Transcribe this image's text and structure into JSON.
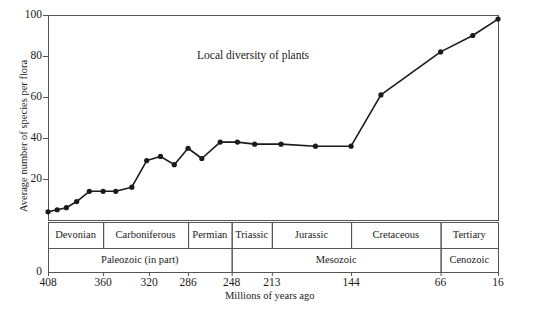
{
  "chart_data": {
    "type": "line",
    "title": "Local diversity of plants",
    "xlabel": "Millions of years ago",
    "ylabel": "Average number of species per flora",
    "xlim": [
      408,
      16
    ],
    "ylim": [
      0,
      100
    ],
    "x_reversed": true,
    "grid": false,
    "legend": "none",
    "xticks": [
      408,
      360,
      320,
      286,
      248,
      213,
      144,
      66,
      16
    ],
    "xtick_labels": [
      "408",
      "360",
      "320",
      "286",
      "248",
      "213",
      "144",
      "66",
      "16"
    ],
    "yticks": [
      0,
      20,
      40,
      60,
      80,
      100
    ],
    "ytick_labels": [
      "0",
      "20",
      "40",
      "60",
      "80",
      "100"
    ],
    "marker": "filled-circle",
    "line_color": "#1a1a1a",
    "series": [
      {
        "name": "Local diversity of plants",
        "x": [
          408,
          400,
          392,
          383,
          372,
          360,
          349,
          335,
          322,
          310,
          298,
          286,
          274,
          258,
          243,
          228,
          205,
          175,
          144,
          118,
          66,
          38,
          16
        ],
        "y": [
          4,
          5,
          6,
          9,
          14,
          14,
          14,
          16,
          29,
          31,
          27,
          35,
          30,
          38,
          38,
          37,
          37,
          36,
          36,
          61,
          82,
          90,
          98
        ]
      }
    ],
    "period_bands": [
      {
        "label": "Devonian",
        "start": 408,
        "end": 360
      },
      {
        "label": "Carboniferous",
        "start": 360,
        "end": 286
      },
      {
        "label": "Permian",
        "start": 286,
        "end": 248
      },
      {
        "label": "Triassic",
        "start": 248,
        "end": 213
      },
      {
        "label": "Jurassic",
        "start": 213,
        "end": 144
      },
      {
        "label": "Cretaceous",
        "start": 144,
        "end": 66
      },
      {
        "label": "Tertiary",
        "start": 66,
        "end": 16
      }
    ],
    "era_bands": [
      {
        "label": "Paleozoic (in part)",
        "start": 408,
        "end": 248
      },
      {
        "label": "Mesozoic",
        "start": 248,
        "end": 66
      },
      {
        "label": "Cenozoic",
        "start": 66,
        "end": 16
      }
    ]
  }
}
